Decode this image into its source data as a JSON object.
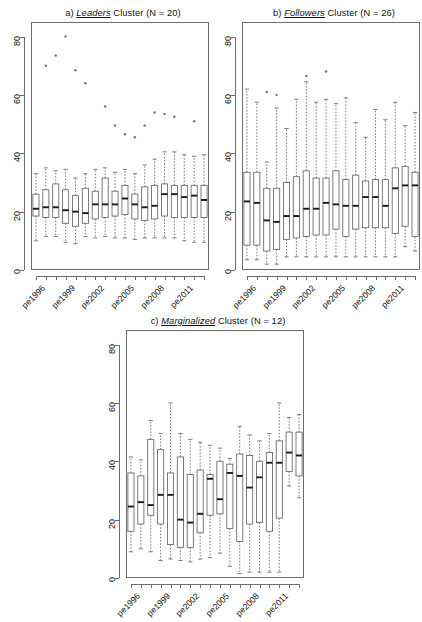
{
  "figure": {
    "width": 422,
    "height": 616,
    "background": "#ffffff",
    "line_color": "#6d6d6d",
    "median_color": "#1a1a1a",
    "outlier_color": "#777777"
  },
  "chart_data": [
    {
      "type": "box",
      "panel_id": "a",
      "title_prefix": "a)",
      "title_emphasis": "Leaders",
      "title_suffix": "Cluster (N = 20)",
      "title": "a) Leaders Cluster (N = 20)",
      "xlabel": "",
      "ylabel": "",
      "ylim": [
        0,
        85
      ],
      "yticks": [
        0,
        20,
        40,
        60,
        80
      ],
      "ticklabels": [
        "0",
        "20",
        "40",
        "60",
        "80"
      ],
      "grid": false,
      "legend": "none",
      "categories": [
        "pe1996",
        "pe1997",
        "pe1998",
        "pe1999",
        "pe2000",
        "pe2001",
        "pe2002",
        "pe2003",
        "pe2004",
        "pe2005",
        "pe2006",
        "pe2007",
        "pe2008",
        "pe2009",
        "pe2010",
        "pe2011",
        "pe2012",
        "pe2013"
      ],
      "xtick_labels_shown": [
        "pe1996",
        "pe1999",
        "pe2002",
        "pe2005",
        "pe2008",
        "pe2011"
      ],
      "xtick_label_indices": [
        0,
        3,
        6,
        9,
        12,
        15
      ],
      "boxes": [
        {
          "x": "pe1996",
          "min": 10.0,
          "q1": 18.5,
          "median": 21.0,
          "q3": 26.0,
          "max": 33.0,
          "outliers": []
        },
        {
          "x": "pe1997",
          "min": 11.5,
          "q1": 18.0,
          "median": 21.5,
          "q3": 27.5,
          "max": 35.0,
          "outliers": [
            70.0
          ]
        },
        {
          "x": "pe1998",
          "min": 11.5,
          "q1": 18.0,
          "median": 21.5,
          "q3": 29.5,
          "max": 34.0,
          "outliers": [
            73.5
          ]
        },
        {
          "x": "pe1999",
          "min": 9.5,
          "q1": 16.0,
          "median": 20.5,
          "q3": 27.5,
          "max": 34.5,
          "outliers": [
            80.0
          ]
        },
        {
          "x": "pe2000",
          "min": 9.0,
          "q1": 15.0,
          "median": 20.0,
          "q3": 25.5,
          "max": 31.5,
          "outliers": [
            68.5
          ]
        },
        {
          "x": "pe2001",
          "min": 11.5,
          "q1": 16.0,
          "median": 19.5,
          "q3": 28.0,
          "max": 33.0,
          "outliers": [
            64.0
          ]
        },
        {
          "x": "pe2002",
          "min": 11.0,
          "q1": 17.5,
          "median": 22.5,
          "q3": 27.0,
          "max": 34.5,
          "outliers": []
        },
        {
          "x": "pe2003",
          "min": 11.5,
          "q1": 18.0,
          "median": 22.5,
          "q3": 31.5,
          "max": 35.0,
          "outliers": [
            56.0
          ]
        },
        {
          "x": "pe2004",
          "min": 11.0,
          "q1": 18.5,
          "median": 22.5,
          "q3": 27.0,
          "max": 33.5,
          "outliers": [
            49.5
          ]
        },
        {
          "x": "pe2005",
          "min": 11.0,
          "q1": 19.0,
          "median": 24.5,
          "q3": 29.0,
          "max": 34.5,
          "outliers": [
            46.5
          ]
        },
        {
          "x": "pe2006",
          "min": 10.5,
          "q1": 17.5,
          "median": 22.5,
          "q3": 26.0,
          "max": 33.0,
          "outliers": [
            45.5
          ]
        },
        {
          "x": "pe2007",
          "min": 11.0,
          "q1": 17.0,
          "median": 21.5,
          "q3": 28.5,
          "max": 36.0,
          "outliers": [
            49.5
          ]
        },
        {
          "x": "pe2008",
          "min": 11.0,
          "q1": 17.5,
          "median": 22.0,
          "q3": 29.0,
          "max": 38.0,
          "outliers": [
            54.0
          ]
        },
        {
          "x": "pe2009",
          "min": 11.0,
          "q1": 18.5,
          "median": 26.0,
          "q3": 29.5,
          "max": 40.5,
          "outliers": [
            53.5
          ]
        },
        {
          "x": "pe2010",
          "min": 11.0,
          "q1": 18.0,
          "median": 26.0,
          "q3": 29.0,
          "max": 40.5,
          "outliers": [
            52.5
          ]
        },
        {
          "x": "pe2011",
          "min": 10.0,
          "q1": 18.0,
          "median": 25.0,
          "q3": 29.0,
          "max": 39.5,
          "outliers": []
        },
        {
          "x": "pe2012",
          "min": 9.5,
          "q1": 18.0,
          "median": 25.5,
          "q3": 29.0,
          "max": 39.0,
          "outliers": [
            51.0
          ]
        },
        {
          "x": "pe2013",
          "min": 9.5,
          "q1": 18.0,
          "median": 24.0,
          "q3": 29.0,
          "max": 39.5,
          "outliers": []
        }
      ]
    },
    {
      "type": "box",
      "panel_id": "b",
      "title_prefix": "b)",
      "title_emphasis": "Followers",
      "title_suffix": "Cluster (N = 26)",
      "title": "b) Followers Cluster (N = 26)",
      "xlabel": "",
      "ylabel": "",
      "ylim": [
        0,
        85
      ],
      "yticks": [
        0,
        20,
        40,
        60,
        80
      ],
      "ticklabels": [
        "0",
        "20",
        "40",
        "60",
        "80"
      ],
      "grid": false,
      "legend": "none",
      "categories": [
        "pe1996",
        "pe1997",
        "pe1998",
        "pe1999",
        "pe2000",
        "pe2001",
        "pe2002",
        "pe2003",
        "pe2004",
        "pe2005",
        "pe2006",
        "pe2007",
        "pe2008",
        "pe2009",
        "pe2010",
        "pe2011",
        "pe2012",
        "pe2013"
      ],
      "xtick_labels_shown": [
        "pe1996",
        "pe1999",
        "pe2002",
        "pe2005",
        "pe2008",
        "pe2011"
      ],
      "xtick_label_indices": [
        0,
        3,
        6,
        9,
        12,
        15
      ],
      "boxes": [
        {
          "x": "pe1996",
          "min": 3.5,
          "q1": 8.5,
          "median": 23.5,
          "q3": 33.5,
          "max": 62.0,
          "outliers": []
        },
        {
          "x": "pe1997",
          "min": 3.5,
          "q1": 8.5,
          "median": 23.0,
          "q3": 33.5,
          "max": 57.5,
          "outliers": []
        },
        {
          "x": "pe1998",
          "min": 2.0,
          "q1": 6.5,
          "median": 17.0,
          "q3": 28.0,
          "max": 37.0,
          "outliers": [
            61.0
          ]
        },
        {
          "x": "pe1999",
          "min": 2.0,
          "q1": 7.0,
          "median": 16.5,
          "q3": 28.0,
          "max": 55.5,
          "outliers": [
            60.0
          ]
        },
        {
          "x": "pe2000",
          "min": 4.5,
          "q1": 10.5,
          "median": 18.5,
          "q3": 30.0,
          "max": 48.5,
          "outliers": []
        },
        {
          "x": "pe2001",
          "min": 4.5,
          "q1": 11.0,
          "median": 18.5,
          "q3": 32.0,
          "max": 58.5,
          "outliers": []
        },
        {
          "x": "pe2002",
          "min": 4.5,
          "q1": 11.5,
          "median": 21.0,
          "q3": 34.0,
          "max": 64.5,
          "outliers": [
            66.5
          ]
        },
        {
          "x": "pe2003",
          "min": 4.5,
          "q1": 12.0,
          "median": 21.0,
          "q3": 31.5,
          "max": 57.5,
          "outliers": []
        },
        {
          "x": "pe2004",
          "min": 4.5,
          "q1": 12.0,
          "median": 23.0,
          "q3": 31.5,
          "max": 58.5,
          "outliers": [
            68.0
          ]
        },
        {
          "x": "pe2005",
          "min": 4.5,
          "q1": 14.0,
          "median": 22.5,
          "q3": 34.0,
          "max": 57.0,
          "outliers": []
        },
        {
          "x": "pe2006",
          "min": 4.5,
          "q1": 11.5,
          "median": 22.0,
          "q3": 31.0,
          "max": 59.0,
          "outliers": []
        },
        {
          "x": "pe2007",
          "min": 4.5,
          "q1": 14.0,
          "median": 22.0,
          "q3": 32.5,
          "max": 50.5,
          "outliers": []
        },
        {
          "x": "pe2008",
          "min": 4.5,
          "q1": 14.5,
          "median": 25.0,
          "q3": 30.5,
          "max": 45.5,
          "outliers": []
        },
        {
          "x": "pe2009",
          "min": 4.5,
          "q1": 14.5,
          "median": 25.0,
          "q3": 31.0,
          "max": 55.0,
          "outliers": []
        },
        {
          "x": "pe2010",
          "min": 4.5,
          "q1": 14.5,
          "median": 22.0,
          "q3": 31.0,
          "max": 51.5,
          "outliers": []
        },
        {
          "x": "pe2011",
          "min": 4.5,
          "q1": 12.5,
          "median": 28.0,
          "q3": 35.0,
          "max": 57.5,
          "outliers": []
        },
        {
          "x": "pe2012",
          "min": 8.0,
          "q1": 15.0,
          "median": 29.0,
          "q3": 35.5,
          "max": 49.5,
          "outliers": []
        },
        {
          "x": "pe2013",
          "min": 6.5,
          "q1": 11.5,
          "median": 29.0,
          "q3": 33.5,
          "max": 54.0,
          "outliers": []
        }
      ]
    },
    {
      "type": "box",
      "panel_id": "c",
      "title_prefix": "c)",
      "title_emphasis": "Marginalized",
      "title_suffix": "Cluster (N = 12)",
      "title": "c) Marginalized Cluster (N = 12)",
      "xlabel": "",
      "ylabel": "",
      "ylim": [
        0,
        85
      ],
      "yticks": [
        0,
        20,
        40,
        60,
        80
      ],
      "ticklabels": [
        "0",
        "20",
        "40",
        "60",
        "80"
      ],
      "grid": false,
      "legend": "none",
      "categories": [
        "pe1996",
        "pe1997",
        "pe1998",
        "pe1999",
        "pe2000",
        "pe2001",
        "pe2002",
        "pe2003",
        "pe2004",
        "pe2005",
        "pe2006",
        "pe2007",
        "pe2008",
        "pe2009",
        "pe2010",
        "pe2011",
        "pe2012",
        "pe2013"
      ],
      "xtick_labels_shown": [
        "pe1996",
        "pe1999",
        "pe2002",
        "pe2005",
        "pe2008",
        "pe2011"
      ],
      "xtick_label_indices": [
        0,
        3,
        6,
        9,
        12,
        15
      ],
      "boxes": [
        {
          "x": "pe1996",
          "min": 9.0,
          "q1": 16.0,
          "median": 24.5,
          "q3": 36.0,
          "max": 41.5,
          "outliers": []
        },
        {
          "x": "pe1997",
          "min": 10.0,
          "q1": 18.5,
          "median": 26.0,
          "q3": 35.0,
          "max": 40.5,
          "outliers": []
        },
        {
          "x": "pe1998",
          "min": 9.0,
          "q1": 21.5,
          "median": 25.0,
          "q3": 47.5,
          "max": 54.0,
          "outliers": []
        },
        {
          "x": "pe1999",
          "min": 6.0,
          "q1": 18.5,
          "median": 28.5,
          "q3": 44.0,
          "max": 49.5,
          "outliers": []
        },
        {
          "x": "pe2000",
          "min": 6.5,
          "q1": 11.5,
          "median": 28.5,
          "q3": 36.0,
          "max": 60.0,
          "outliers": []
        },
        {
          "x": "pe2001",
          "min": 6.0,
          "q1": 10.5,
          "median": 20.0,
          "q3": 41.5,
          "max": 49.5,
          "outliers": []
        },
        {
          "x": "pe2002",
          "min": 5.5,
          "q1": 10.5,
          "median": 19.0,
          "q3": 35.5,
          "max": 47.5,
          "outliers": []
        },
        {
          "x": "pe2003",
          "min": 6.5,
          "q1": 15.5,
          "median": 22.0,
          "q3": 37.0,
          "max": 46.5,
          "outliers": []
        },
        {
          "x": "pe2004",
          "min": 7.0,
          "q1": 21.5,
          "median": 34.0,
          "q3": 35.5,
          "max": 45.5,
          "outliers": []
        },
        {
          "x": "pe2005",
          "min": 8.5,
          "q1": 22.0,
          "median": 27.0,
          "q3": 40.0,
          "max": 44.5,
          "outliers": []
        },
        {
          "x": "pe2006",
          "min": 4.0,
          "q1": 17.0,
          "median": 36.0,
          "q3": 39.0,
          "max": 41.0,
          "outliers": []
        },
        {
          "x": "pe2007",
          "min": 1.5,
          "q1": 12.5,
          "median": 35.0,
          "q3": 42.5,
          "max": 52.0,
          "outliers": []
        },
        {
          "x": "pe2008",
          "min": 2.0,
          "q1": 18.5,
          "median": 31.0,
          "q3": 42.0,
          "max": 49.0,
          "outliers": []
        },
        {
          "x": "pe2009",
          "min": 2.0,
          "q1": 19.0,
          "median": 34.5,
          "q3": 40.0,
          "max": 47.0,
          "outliers": []
        },
        {
          "x": "pe2010",
          "min": 2.0,
          "q1": 16.0,
          "median": 39.5,
          "q3": 43.0,
          "max": 49.5,
          "outliers": []
        },
        {
          "x": "pe2011",
          "min": 2.0,
          "q1": 20.5,
          "median": 39.5,
          "q3": 47.0,
          "max": 60.0,
          "outliers": []
        },
        {
          "x": "pe2012",
          "min": 31.5,
          "q1": 36.5,
          "median": 43.0,
          "q3": 50.0,
          "max": 55.0,
          "outliers": []
        },
        {
          "x": "pe2013",
          "min": 27.5,
          "q1": 35.0,
          "median": 42.0,
          "q3": 50.0,
          "max": 56.0,
          "outliers": []
        }
      ]
    }
  ]
}
